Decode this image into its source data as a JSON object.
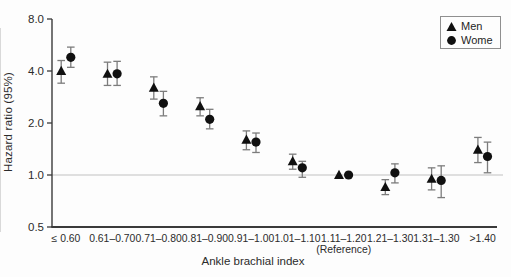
{
  "figure": {
    "background": "#fdfdfd",
    "marker_color": "#101010",
    "errorbar_color": "#7c7c7c",
    "axis_color": "#3a3a3a",
    "reference_line_color": "#c2c2c2"
  },
  "legend": {
    "items": [
      {
        "marker": "triangle",
        "label": "Men"
      },
      {
        "marker": "circle",
        "label": "Wome"
      }
    ]
  },
  "chart_data": {
    "type": "scatter",
    "subtype": "point-estimates-with-95ci-log-scale",
    "title": "",
    "xlabel": "Ankle brachial index",
    "ylabel": "Hazard ratio (95%)",
    "yscale": "log2",
    "ylim": [
      0.5,
      8.0
    ],
    "yticks": [
      8.0,
      4.0,
      2.0,
      1.0,
      0.5
    ],
    "ytick_labels": [
      "8.0",
      "4.0",
      "2.0",
      "1.0",
      "0.5"
    ],
    "reference_line_y": 1.0,
    "grid": "off",
    "legend_position": "top-right",
    "categories": [
      {
        "label": "≤ 0.60"
      },
      {
        "label": "0.61–0.70"
      },
      {
        "label": "0.71–0.80"
      },
      {
        "label": "0.81–0.90"
      },
      {
        "label": "0.91–1.00"
      },
      {
        "label": "1.01–1.10"
      },
      {
        "label": "1.11–1.20",
        "sublabel": "(Reference)"
      },
      {
        "label": "1.21–1.30"
      },
      {
        "label": "1.31–1.30"
      },
      {
        "label": ">1.40"
      }
    ],
    "series": [
      {
        "name": "Men",
        "marker": "triangle",
        "values": [
          4.0,
          3.85,
          3.2,
          2.5,
          1.6,
          1.2,
          1.0,
          0.85,
          0.95,
          1.4
        ],
        "ci_low": [
          3.4,
          3.3,
          2.75,
          2.2,
          1.4,
          1.08,
          null,
          0.77,
          0.82,
          1.18
        ],
        "ci_high": [
          4.6,
          4.5,
          3.7,
          2.8,
          1.8,
          1.32,
          null,
          0.94,
          1.1,
          1.65
        ]
      },
      {
        "name": "Women",
        "marker": "circle",
        "values": [
          4.8,
          3.85,
          2.6,
          2.1,
          1.55,
          1.1,
          1.0,
          1.03,
          0.93,
          1.28
        ],
        "ci_low": [
          4.2,
          3.3,
          2.2,
          1.85,
          1.35,
          0.97,
          null,
          0.9,
          0.74,
          1.03
        ],
        "ci_high": [
          5.5,
          4.55,
          3.05,
          2.4,
          1.75,
          1.2,
          null,
          1.16,
          1.13,
          1.55
        ]
      }
    ]
  }
}
